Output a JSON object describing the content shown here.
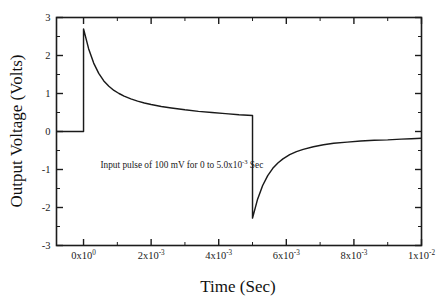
{
  "chart_data": {
    "type": "line",
    "title": "",
    "xlabel": "Time (Sec)",
    "ylabel": "Output Voltage (Volts)",
    "xlim": [
      -0.0008,
      0.01
    ],
    "ylim": [
      -3,
      3
    ],
    "grid": false,
    "legend": null,
    "annotations": [
      {
        "text_parts": {
          "before": "Input pulse of 100 mV for 0 to 5.0x10",
          "superscript": "-3",
          "after": " Sec"
        },
        "full_text": "Input pulse of 100 mV for 0 to 5.0x10-3 Sec",
        "x": 0.0005,
        "y": -0.95
      }
    ],
    "xticks": [
      {
        "value": 0.0,
        "mantissa": "0x10",
        "exponent": "0",
        "label": "0x10^0"
      },
      {
        "value": 0.002,
        "mantissa": "2x10",
        "exponent": "-3",
        "label": "2x10^-3"
      },
      {
        "value": 0.004,
        "mantissa": "4x10",
        "exponent": "-3",
        "label": "4x10^-3"
      },
      {
        "value": 0.006,
        "mantissa": "6x10",
        "exponent": "-3",
        "label": "6x10^-3"
      },
      {
        "value": 0.008,
        "mantissa": "8x10",
        "exponent": "-3",
        "label": "8x10^-3"
      },
      {
        "value": 0.01,
        "mantissa": "1x10",
        "exponent": "-2",
        "label": "1x10^-2"
      }
    ],
    "xminorticks": [
      0.001,
      0.003,
      0.005,
      0.007,
      0.009
    ],
    "yticks": [
      {
        "value": 3,
        "label": "3"
      },
      {
        "value": 2,
        "label": "2"
      },
      {
        "value": 1,
        "label": "1"
      },
      {
        "value": 0,
        "label": "0"
      },
      {
        "value": -1,
        "label": "-1"
      },
      {
        "value": -2,
        "label": "-2"
      },
      {
        "value": -3,
        "label": "-3"
      }
    ],
    "yminorticks": [
      2.5,
      1.5,
      0.5,
      -0.5,
      -1.5,
      -2.5
    ],
    "series": [
      {
        "name": "Output Voltage",
        "color": "#1a1a1a",
        "description": "Pulse response of a high-pass / differentiator circuit: flat 0 V baseline before t=0, sharp rise to +2.70 V at t=0, exponential decay to +0.42 V at t=5.0e-3, sharp fall to -2.28 V, exponential recovery toward -0.18 V.",
        "points": [
          {
            "x": -0.0008,
            "y": 0.0
          },
          {
            "x": 0.0,
            "y": 0.0
          },
          {
            "x": 0.0,
            "y": 2.7
          },
          {
            "x": 0.00015,
            "y": 2.18
          },
          {
            "x": 0.0003,
            "y": 1.8
          },
          {
            "x": 0.00045,
            "y": 1.53
          },
          {
            "x": 0.0006,
            "y": 1.33
          },
          {
            "x": 0.00075,
            "y": 1.19
          },
          {
            "x": 0.0009,
            "y": 1.08
          },
          {
            "x": 0.00105,
            "y": 1.0
          },
          {
            "x": 0.0012,
            "y": 0.93
          },
          {
            "x": 0.0014,
            "y": 0.86
          },
          {
            "x": 0.0016,
            "y": 0.8
          },
          {
            "x": 0.0018,
            "y": 0.75
          },
          {
            "x": 0.002,
            "y": 0.71
          },
          {
            "x": 0.0023,
            "y": 0.66
          },
          {
            "x": 0.0026,
            "y": 0.62
          },
          {
            "x": 0.003,
            "y": 0.57
          },
          {
            "x": 0.0034,
            "y": 0.53
          },
          {
            "x": 0.0038,
            "y": 0.5
          },
          {
            "x": 0.0042,
            "y": 0.47
          },
          {
            "x": 0.0046,
            "y": 0.44
          },
          {
            "x": 0.005,
            "y": 0.42
          },
          {
            "x": 0.005,
            "y": -2.28
          },
          {
            "x": 0.00515,
            "y": -1.78
          },
          {
            "x": 0.0053,
            "y": -1.42
          },
          {
            "x": 0.00545,
            "y": -1.16
          },
          {
            "x": 0.0056,
            "y": -0.97
          },
          {
            "x": 0.00575,
            "y": -0.83
          },
          {
            "x": 0.0059,
            "y": -0.72
          },
          {
            "x": 0.0061,
            "y": -0.61
          },
          {
            "x": 0.0063,
            "y": -0.53
          },
          {
            "x": 0.0065,
            "y": -0.47
          },
          {
            "x": 0.0068,
            "y": -0.4
          },
          {
            "x": 0.0071,
            "y": -0.35
          },
          {
            "x": 0.0074,
            "y": -0.31
          },
          {
            "x": 0.0078,
            "y": -0.28
          },
          {
            "x": 0.0082,
            "y": -0.25
          },
          {
            "x": 0.0086,
            "y": -0.23
          },
          {
            "x": 0.009,
            "y": -0.22
          },
          {
            "x": 0.0094,
            "y": -0.2
          },
          {
            "x": 0.0097,
            "y": -0.19
          },
          {
            "x": 0.01,
            "y": -0.18
          }
        ]
      }
    ]
  }
}
